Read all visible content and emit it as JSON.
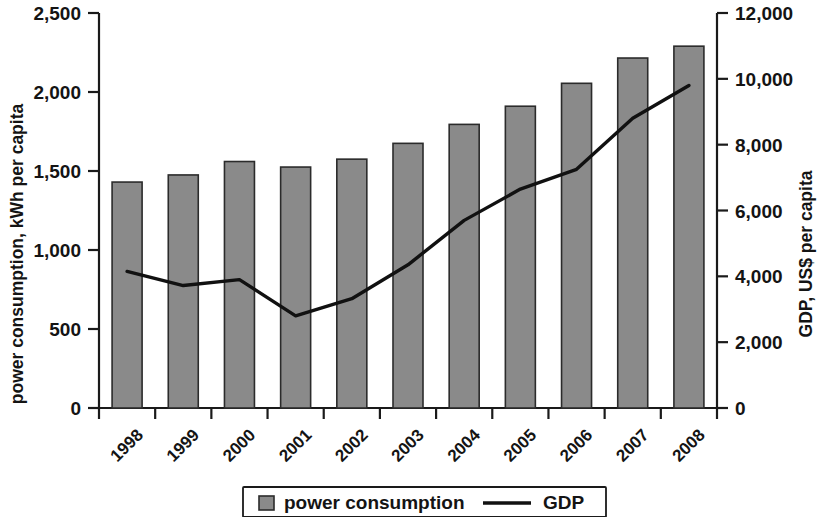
{
  "chart_data": {
    "type": "bar",
    "title": "",
    "subtitle": "",
    "xlabel": "",
    "categories": [
      "1998",
      "1999",
      "2000",
      "2001",
      "2002",
      "2003",
      "2004",
      "2005",
      "2006",
      "2007",
      "2008"
    ],
    "grid": false,
    "legend_position": "bottom",
    "series": [
      {
        "name": "power consumption",
        "type": "bar",
        "axis": "left",
        "color": "#8a8a8a",
        "edge_color": "#2b2b2b",
        "values": [
          1430,
          1475,
          1560,
          1525,
          1575,
          1675,
          1795,
          1910,
          2055,
          2215,
          2290
        ]
      },
      {
        "name": "GDP",
        "type": "line",
        "axis": "right",
        "color": "#111111",
        "values": [
          4150,
          3720,
          3900,
          2800,
          3320,
          4350,
          5700,
          6650,
          7250,
          8800,
          9800
        ]
      }
    ],
    "left_axis": {
      "label": "power consumption, kWh per capita",
      "ticks": [
        0,
        500,
        1000,
        1500,
        2000,
        2500
      ],
      "tick_labels": [
        "0",
        "500",
        "1,000",
        "1,500",
        "2,000",
        "2,500"
      ],
      "min": 0,
      "max": 2500
    },
    "right_axis": {
      "label": "GDP, US$ per capita",
      "ticks": [
        0,
        2000,
        4000,
        6000,
        8000,
        10000,
        12000
      ],
      "tick_labels": [
        "0",
        "2,000",
        "4,000",
        "6,000",
        "8,000",
        "10,000",
        "12,000"
      ],
      "min": 0,
      "max": 12000
    },
    "legend": {
      "items": [
        {
          "label": "power consumption",
          "marker": "square",
          "color": "#8a8a8a"
        },
        {
          "label": "GDP",
          "marker": "line",
          "color": "#111111"
        }
      ]
    }
  }
}
